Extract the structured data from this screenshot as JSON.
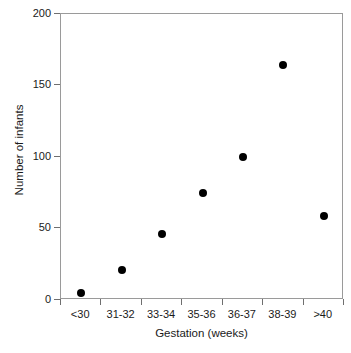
{
  "chart_data": {
    "type": "scatter",
    "title": "",
    "xlabel": "Gestation (weeks)",
    "ylabel": "Number of infants",
    "categories": [
      "<30",
      "31-32",
      "33-34",
      "35-36",
      "36-37",
      "38-39",
      ">40"
    ],
    "values": [
      5,
      21,
      46,
      75,
      100,
      164,
      59
    ],
    "series": [
      {
        "name": "Number of infants",
        "values": [
          5,
          21,
          46,
          75,
          100,
          164,
          59
        ]
      }
    ],
    "ylim": [
      0,
      200
    ],
    "yticks": [
      0,
      50,
      100,
      150,
      200
    ],
    "ytick_labels": [
      "0",
      "50",
      "100",
      "150",
      "200"
    ],
    "grid": false,
    "legend": false,
    "marker": "filled-circle",
    "marker_color": "#000000",
    "frame_color": "#9a9a9a",
    "background": "#ffffff"
  }
}
